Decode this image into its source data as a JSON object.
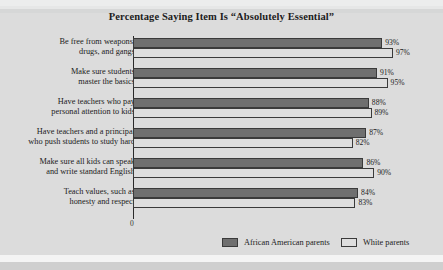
{
  "chart_data": {
    "type": "bar",
    "orientation": "horizontal",
    "title": "Percentage Saying Item Is “Absolutely Essential”",
    "xlabel": "",
    "ylabel": "",
    "xlim": [
      0,
      100
    ],
    "grid": false,
    "axis_origin_label": "0",
    "legend_position": "bottom",
    "value_suffix": "%",
    "categories": [
      "Be free from weapons, drugs, and gangs",
      "Make sure students master the basics",
      "Have teachers who pay personal attention to kids",
      "Have teachers and a principal who push students to study hard",
      "Make sure all kids can speak and write standard English",
      "Teach values, such as honesty and respect"
    ],
    "category_lines": [
      [
        "Be free from weapons,",
        "drugs, and gangs"
      ],
      [
        "Make sure students",
        "master the basics"
      ],
      [
        "Have teachers who pay",
        "personal attention to kids"
      ],
      [
        "Have teachers and a principal",
        "who push students to study hard"
      ],
      [
        "Make sure all kids can speak",
        "and write standard English"
      ],
      [
        "Teach values, such as",
        "honesty and respect"
      ]
    ],
    "series": [
      {
        "name": "African American parents",
        "color": "#6f6f6f",
        "values": [
          93,
          91,
          88,
          87,
          86,
          84
        ],
        "labels": [
          "93%",
          "91%",
          "88%",
          "87%",
          "86%",
          "84%"
        ]
      },
      {
        "name": "White parents",
        "color": "#dedede",
        "values": [
          97,
          95,
          89,
          82,
          90,
          83
        ],
        "labels": [
          "97%",
          "95%",
          "89%",
          "82%",
          "90%",
          "83%"
        ]
      }
    ]
  }
}
